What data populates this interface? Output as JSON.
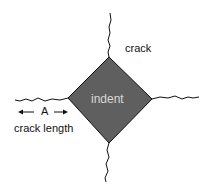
{
  "diagram": {
    "labels": {
      "crack": "crack",
      "indent": "indent",
      "arrow_letter": "A",
      "crack_length": "crack length"
    },
    "colors": {
      "indent_fill": "#5f5f5f",
      "indent_text": "#d8d8d8",
      "lines": "#111111"
    }
  }
}
